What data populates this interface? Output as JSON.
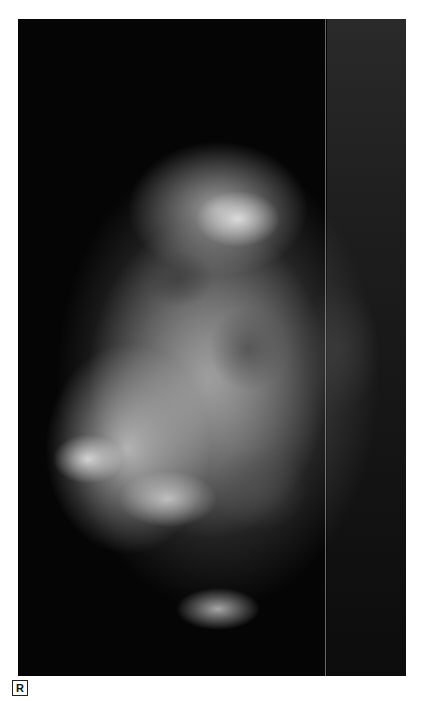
{
  "image": {
    "type": "mammogram",
    "description": "Grayscale X-ray film of breast tissue with dense fibroglandular pattern"
  },
  "laterality_marker": {
    "label": "R"
  }
}
